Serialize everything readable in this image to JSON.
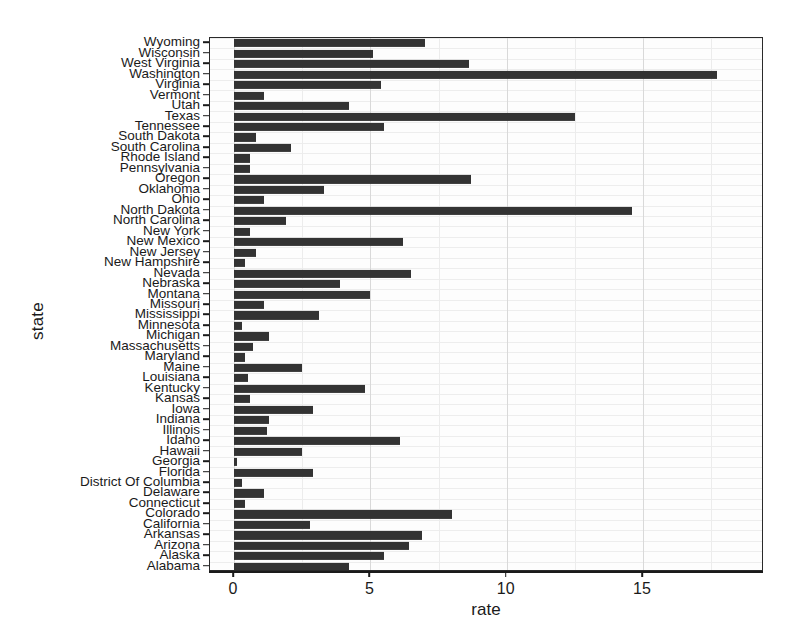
{
  "chart_data": {
    "type": "bar",
    "orientation": "horizontal",
    "title": "",
    "xlabel": "rate",
    "ylabel": "state",
    "xlim": [
      0,
      19.4
    ],
    "xticks": [
      0,
      5,
      10,
      15
    ],
    "xtick_labels": [
      "0",
      "5",
      "10",
      "15"
    ],
    "grid": true,
    "legend": "none",
    "bar_color": "#333333",
    "panel_background": "#fdfdfd",
    "categories": [
      "Wyoming",
      "Wisconsin",
      "West Virginia",
      "Washington",
      "Virginia",
      "Vermont",
      "Utah",
      "Texas",
      "Tennessee",
      "South Dakota",
      "South Carolina",
      "Rhode Island",
      "Pennsylvania",
      "Oregon",
      "Oklahoma",
      "Ohio",
      "North Dakota",
      "North Carolina",
      "New York",
      "New Mexico",
      "New Jersey",
      "New Hampshire",
      "Nevada",
      "Nebraska",
      "Montana",
      "Missouri",
      "Mississippi",
      "Minnesota",
      "Michigan",
      "Massachusetts",
      "Maryland",
      "Maine",
      "Louisiana",
      "Kentucky",
      "Kansas",
      "Iowa",
      "Indiana",
      "Illinois",
      "Idaho",
      "Hawaii",
      "Georgia",
      "Florida",
      "District Of Columbia",
      "Delaware",
      "Connecticut",
      "Colorado",
      "California",
      "Arkansas",
      "Arizona",
      "Alaska",
      "Alabama"
    ],
    "values": [
      7.0,
      5.1,
      8.6,
      17.7,
      5.4,
      1.1,
      4.2,
      12.5,
      5.5,
      0.8,
      2.1,
      0.6,
      0.6,
      8.7,
      3.3,
      1.1,
      14.6,
      1.9,
      0.6,
      6.2,
      0.8,
      0.4,
      6.5,
      3.9,
      5.0,
      1.1,
      3.1,
      0.3,
      1.3,
      0.7,
      0.4,
      2.5,
      0.5,
      4.8,
      0.6,
      2.9,
      1.3,
      1.2,
      6.1,
      2.5,
      0.1,
      2.9,
      0.3,
      1.1,
      0.4,
      8.0,
      2.8,
      6.9,
      6.4,
      5.5,
      4.2
    ]
  }
}
